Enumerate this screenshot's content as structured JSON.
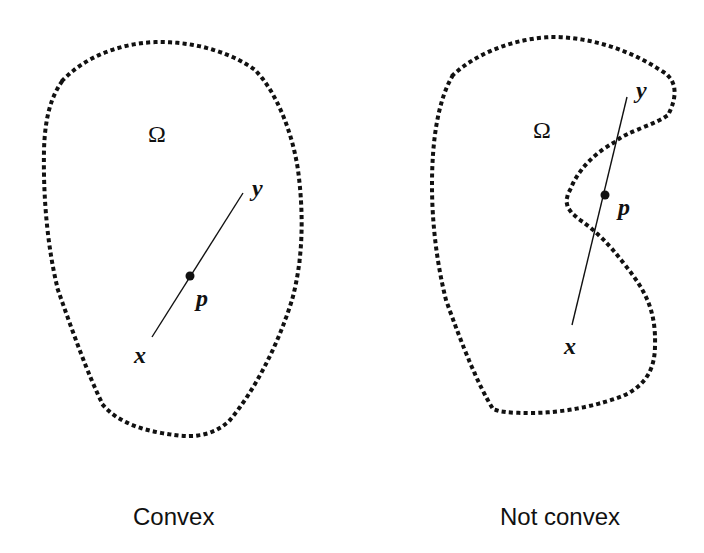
{
  "figure": {
    "panels": [
      {
        "id": "convex",
        "caption": "Convex",
        "region_label": "Ω",
        "endpoint_start_label": "x",
        "endpoint_end_label": "y",
        "midpoint_label": "p",
        "is_convex": true
      },
      {
        "id": "not-convex",
        "caption": "Not convex",
        "region_label": "Ω",
        "endpoint_start_label": "x",
        "endpoint_end_label": "y",
        "midpoint_label": "p",
        "is_convex": false
      }
    ],
    "colors": {
      "stroke": "#111111",
      "background": "#ffffff"
    }
  }
}
